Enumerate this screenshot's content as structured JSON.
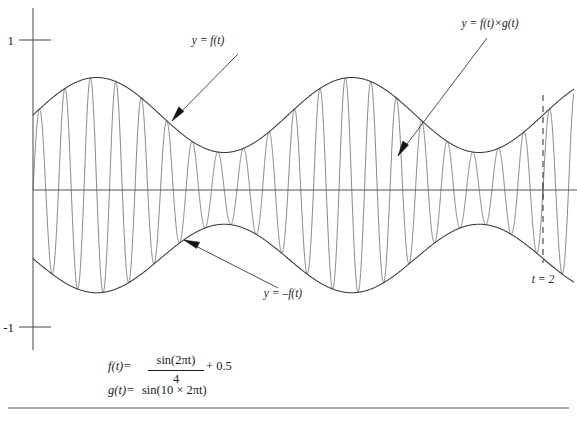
{
  "figure": {
    "background_color": "#ffffff",
    "axis_color": "#57575a",
    "curve_color": "#6d6d70",
    "envelope_color": "#3a3a3c",
    "label_color": "#1d1d1f"
  },
  "axes": {
    "y_ticks": [
      {
        "value": 1,
        "label": "1"
      },
      {
        "value": -1,
        "label": "-1"
      }
    ],
    "x_axis_label": "",
    "y_axis_label": "",
    "x_range": [
      0,
      2.12
    ],
    "y_range": [
      -1.12,
      1.12
    ],
    "grid": false
  },
  "markers": {
    "t2": {
      "label": "t = 2",
      "value": 2,
      "style": "dashed-vertical"
    }
  },
  "annotations": [
    {
      "name": "f-of-t",
      "label": "y = f(t)",
      "label_x": 208,
      "label_y": 44,
      "tail_x": 238,
      "tail_y": 54,
      "tip_x": 172,
      "tip_y": 121,
      "anchor": "middle"
    },
    {
      "name": "f-times-g",
      "label": "y = f(t)×g(t)",
      "label_x": 490,
      "label_y": 27,
      "tail_x": 487,
      "tail_y": 38,
      "tip_x": 398,
      "tip_y": 156,
      "anchor": "middle"
    },
    {
      "name": "negative-f-of-t",
      "label": "y = –f(t)",
      "label_x": 283,
      "label_y": 297,
      "tail_x": 278,
      "tail_y": 288,
      "tip_x": 184,
      "tip_y": 240,
      "anchor": "middle"
    }
  ],
  "formulas": [
    {
      "name": "f-definition",
      "lhs": "f(t)=",
      "numerator": "sin(2πt)",
      "denominator": "4",
      "tail": "+ 0.5",
      "x": 108,
      "y": 370
    },
    {
      "name": "g-definition",
      "lhs": "g(t)=",
      "rhs": "sin(10 × 2πt)",
      "x": 108,
      "y": 394
    }
  ],
  "chart_data": {
    "type": "line",
    "xlabel": "t",
    "ylabel": "y",
    "xlim": [
      0,
      2.12
    ],
    "ylim": [
      -1.12,
      1.12
    ],
    "grid": false,
    "legend_position": "inline-annotations",
    "x_tick_labels": [
      "t = 2"
    ],
    "y_tick_labels": [
      "1",
      "-1"
    ],
    "definitions": {
      "f(t)": "sin(2*pi*t)/4 + 0.5",
      "g(t)": "sin(10*2*pi*t)",
      "product": "f(t)*g(t)"
    },
    "series": [
      {
        "name": "y = f(t)",
        "role": "upper-envelope",
        "expression": "sin(2*pi*t)/4 + 0.5",
        "color": "#3a3a3c",
        "sample_points": [
          {
            "t": 0.0,
            "y": 0.5
          },
          {
            "t": 0.25,
            "y": 0.75
          },
          {
            "t": 0.5,
            "y": 0.5
          },
          {
            "t": 0.75,
            "y": 0.25
          },
          {
            "t": 1.0,
            "y": 0.5
          },
          {
            "t": 1.25,
            "y": 0.75
          },
          {
            "t": 1.5,
            "y": 0.5
          },
          {
            "t": 1.75,
            "y": 0.25
          },
          {
            "t": 2.0,
            "y": 0.5
          }
        ]
      },
      {
        "name": "y = -f(t)",
        "role": "lower-envelope",
        "expression": "-(sin(2*pi*t)/4 + 0.5)",
        "color": "#3a3a3c",
        "sample_points": [
          {
            "t": 0.0,
            "y": -0.5
          },
          {
            "t": 0.25,
            "y": -0.75
          },
          {
            "t": 0.5,
            "y": -0.5
          },
          {
            "t": 0.75,
            "y": -0.25
          },
          {
            "t": 1.0,
            "y": -0.5
          },
          {
            "t": 1.25,
            "y": -0.75
          },
          {
            "t": 1.5,
            "y": -0.5
          },
          {
            "t": 1.75,
            "y": -0.25
          },
          {
            "t": 2.0,
            "y": -0.5
          }
        ]
      },
      {
        "name": "y = f(t)×g(t)",
        "role": "modulated-carrier",
        "expression": "(sin(2*pi*t)/4 + 0.5) * sin(10*2*pi*t)",
        "color": "#6d6d70",
        "carrier_cycles_over_range": 20,
        "carrier_frequency": 10
      }
    ]
  },
  "plot_geometry": {
    "x0_px": 33,
    "x_per_unit_px": 255,
    "y0_px": 190,
    "y_per_unit_px_up": 150,
    "y_per_unit_px_down": 137,
    "y_axis_top_px": 8,
    "y_axis_bottom_px": 350,
    "x_axis_right_px": 577,
    "dash_x_px": 543,
    "dash_top_px": 95,
    "dash_bottom_px": 263,
    "bottom_rule_y_px": 408,
    "t2_label_x_px": 543,
    "t2_label_y_px": 283
  }
}
